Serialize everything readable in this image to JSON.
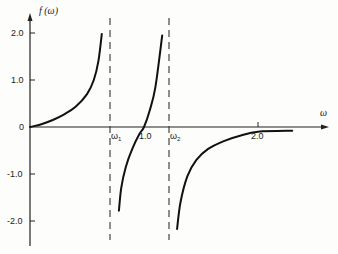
{
  "chart_data": {
    "type": "line",
    "title": "",
    "xlabel": "ω",
    "ylabel": "f (ω)",
    "xlim": [
      0,
      2.6
    ],
    "ylim": [
      -2.5,
      2.3
    ],
    "grid": false,
    "legend": null,
    "x_ticks": [
      {
        "value": 0.7,
        "label": "ω1",
        "kind": "asymptote"
      },
      {
        "value": 1.0,
        "label": "1.0"
      },
      {
        "value": 1.22,
        "label": "ω2",
        "kind": "asymptote"
      },
      {
        "value": 2.0,
        "label": "2.0"
      }
    ],
    "y_ticks": [
      {
        "value": 2.0,
        "label": "2.0"
      },
      {
        "value": 1.0,
        "label": "1.0"
      },
      {
        "value": 0,
        "label": "0"
      },
      {
        "value": -1.0,
        "label": "-1.0"
      },
      {
        "value": -2.0,
        "label": "-2.0"
      }
    ],
    "asymptotes": [
      {
        "name": "ω1",
        "x": 0.7,
        "style": "dashed"
      },
      {
        "name": "ω2",
        "x": 1.22,
        "style": "dashed"
      }
    ],
    "series": [
      {
        "name": "branch-1",
        "x": [
          0.0,
          0.1,
          0.2,
          0.3,
          0.4,
          0.5,
          0.56,
          0.6,
          0.63
        ],
        "y": [
          0.0,
          0.06,
          0.15,
          0.27,
          0.43,
          0.7,
          1.0,
          1.4,
          1.98
        ]
      },
      {
        "name": "branch-2",
        "x": [
          0.78,
          0.8,
          0.84,
          0.9,
          0.96,
          1.0,
          1.05,
          1.1,
          1.16
        ],
        "y": [
          -1.78,
          -1.3,
          -0.85,
          -0.45,
          -0.15,
          0.0,
          0.35,
          0.85,
          1.95
        ]
      },
      {
        "name": "branch-3",
        "x": [
          1.29,
          1.32,
          1.38,
          1.46,
          1.56,
          1.7,
          1.85,
          2.0,
          2.3
        ],
        "y": [
          -2.17,
          -1.6,
          -1.05,
          -0.7,
          -0.47,
          -0.3,
          -0.18,
          -0.1,
          -0.08
        ]
      }
    ]
  },
  "labels": {
    "ylabel": "f (ω)",
    "xlabel": "ω",
    "omega1_main": "ω",
    "omega1_sub": "1",
    "omega2_main": "ω",
    "omega2_sub": "2",
    "x_tick_1": "1.0",
    "x_tick_2": "2.0",
    "y_2": "2.0",
    "y_1": "1.0",
    "y_0": "0",
    "y_m1": "-1.0",
    "y_m2": "-2.0"
  }
}
